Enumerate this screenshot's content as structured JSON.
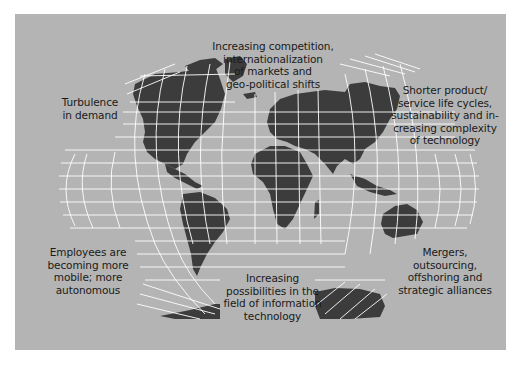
{
  "diagram": {
    "title": "",
    "background_color": "#b4b4b4",
    "land_color": "#3c3c3c",
    "grid_color": "#ffffff",
    "annotations": [
      {
        "id": "top-center",
        "position": "top-center",
        "lines": [
          "Increasing competition,",
          "internationalization",
          "of markets and",
          "geo-political shifts"
        ]
      },
      {
        "id": "top-left",
        "position": "upper-left",
        "lines": [
          "Turbulence",
          "in demand"
        ]
      },
      {
        "id": "top-right",
        "position": "upper-right",
        "lines": [
          "Shorter product/",
          "service life cycles,",
          "sustainability and in-",
          "creasing complexity",
          "of technology"
        ]
      },
      {
        "id": "bottom-left",
        "position": "lower-left",
        "lines": [
          "Employees are",
          "becoming more",
          "mobile; more",
          "autonomous"
        ]
      },
      {
        "id": "bottom-center",
        "position": "bottom-center",
        "lines": [
          "Increasing",
          "possibilities in the",
          "field of information",
          "technology"
        ]
      },
      {
        "id": "bottom-right",
        "position": "lower-right",
        "lines": [
          "Mergers,",
          "outsourcing,",
          "offshoring and",
          "strategic alliances"
        ]
      }
    ],
    "map": {
      "type": "world-map-interrupted-projection",
      "regions": [
        "North America",
        "Greenland",
        "South America",
        "Europe",
        "Africa",
        "Asia",
        "Australia",
        "Antarctica"
      ]
    }
  }
}
